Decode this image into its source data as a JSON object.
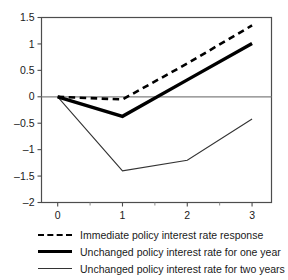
{
  "chart_data": {
    "type": "line",
    "title": "",
    "subtitle": "",
    "xlabel": "",
    "ylabel": "",
    "x": [
      0,
      1,
      2,
      3
    ],
    "xlim": [
      -0.25,
      3.3
    ],
    "ylim": [
      -2,
      1.5
    ],
    "xticks": [
      0,
      1,
      2,
      3
    ],
    "xtick_labels": [
      "0",
      "1",
      "2",
      "3"
    ],
    "yticks": [
      1.5,
      1,
      0.5,
      0,
      -0.5,
      -1,
      -1.5,
      -2
    ],
    "ytick_labels": [
      "1.5",
      "1",
      "0.5",
      "0",
      "–0.5",
      "–1",
      "–1.5",
      "–2"
    ],
    "x_minor_ticks": [
      0.5,
      1.5,
      2.5
    ],
    "grid": false,
    "zero_line": true,
    "zero_line_color": "#808080",
    "legend_position": "below",
    "series": [
      {
        "name": "Immediate policy interest rate response",
        "style": "dashed",
        "color": "#000000",
        "width": 2.6,
        "values": [
          0,
          -0.05,
          0.63,
          1.35
        ]
      },
      {
        "name": "Unchanged policy interest rate for one year",
        "style": "solid-thick",
        "color": "#000000",
        "width": 3.4,
        "values": [
          0,
          -0.37,
          0.32,
          1.01
        ]
      },
      {
        "name": "Unchanged policy interest rate for two years",
        "style": "solid-thin",
        "color": "#333333",
        "width": 1.1,
        "values": [
          0,
          -1.4,
          -1.2,
          -0.42
        ]
      }
    ]
  },
  "legend": {
    "items": [
      {
        "label": "Immediate policy interest rate response"
      },
      {
        "label": "Unchanged policy interest rate for one year"
      },
      {
        "label": "Unchanged policy interest rate for two years"
      }
    ]
  }
}
